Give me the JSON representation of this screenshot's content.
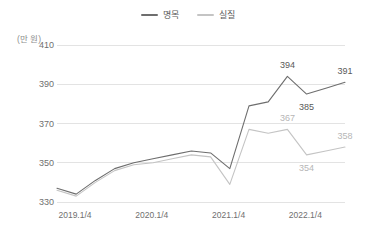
{
  "chart_data": {
    "type": "line",
    "title": "",
    "xlabel": "",
    "ylabel": "",
    "yunit": "(만 원)",
    "ylim": [
      330,
      410
    ],
    "yticks": [
      410,
      390,
      370,
      350,
      330
    ],
    "grid": true,
    "legend_position": "top-center",
    "x": [
      "2019.1/4",
      "2019.2/4",
      "2019.3/4",
      "2019.4/4",
      "2020.1/4",
      "2020.2/4",
      "2020.3/4",
      "2020.4/4",
      "2021.1/4",
      "2021.2/4",
      "2021.3/4",
      "2021.4/4",
      "2022.1/4",
      "2022.2/4",
      "2022.3/4",
      "2022.4/4"
    ],
    "xtick_labels": [
      "2019.1/4",
      "2020.1/4",
      "2021.1/4",
      "2022.1/4"
    ],
    "xtick_indices": [
      0,
      4,
      8,
      12
    ],
    "series": [
      {
        "name": "명목",
        "color": "#6e6e6e",
        "values": [
          337,
          334,
          341,
          347,
          350,
          352,
          354,
          356,
          355,
          347,
          379,
          381,
          394,
          385,
          388,
          391
        ],
        "labels": [
          {
            "index": 12,
            "text": "394",
            "pos": "above"
          },
          {
            "index": 13,
            "text": "385",
            "pos": "below"
          },
          {
            "index": 15,
            "text": "391",
            "pos": "above"
          }
        ]
      },
      {
        "name": "실질",
        "color": "#c4c4c4",
        "values": [
          336,
          333,
          340,
          346,
          349,
          350,
          352,
          354,
          353,
          339,
          367,
          365,
          367,
          354,
          356,
          358
        ],
        "labels": [
          {
            "index": 12,
            "text": "367",
            "pos": "above"
          },
          {
            "index": 13,
            "text": "354",
            "pos": "below"
          },
          {
            "index": 15,
            "text": "358",
            "pos": "above"
          }
        ]
      }
    ]
  },
  "legend": {
    "items": [
      {
        "label": "명목",
        "color": "#6e6e6e"
      },
      {
        "label": "실질",
        "color": "#c4c4c4"
      }
    ]
  },
  "axis": {
    "unit_label": "(만 원)"
  },
  "colors": {
    "nominal": "#6e6e6e",
    "real": "#c4c4c4",
    "grid": "#e3e3e3",
    "tick_text": "#6f6f6f",
    "unit_text": "#8d8d8d",
    "background": "#ffffff"
  }
}
